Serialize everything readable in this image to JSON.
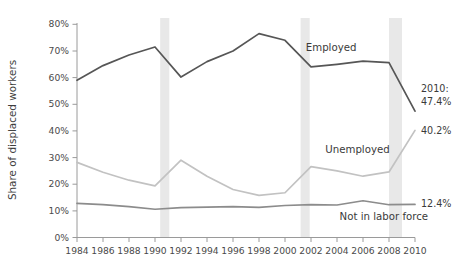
{
  "chart_data": {
    "type": "line",
    "title": "",
    "subtitle": "",
    "xlabel": "",
    "ylabel": "Share of displaced workers",
    "x": [
      1984,
      1986,
      1988,
      1990,
      1992,
      1994,
      1996,
      1998,
      2000,
      2002,
      2004,
      2006,
      2008,
      2010
    ],
    "xlim": [
      1984,
      2010
    ],
    "ylim": [
      0,
      80
    ],
    "y_tick_labels": [
      "0%",
      "10%",
      "20%",
      "30%",
      "40%",
      "50%",
      "60%",
      "70%",
      "80%"
    ],
    "y_tick_values": [
      0,
      10,
      20,
      30,
      40,
      50,
      60,
      70,
      80
    ],
    "x_tick_labels": [
      "1984",
      "1986",
      "1988",
      "1990",
      "1992",
      "1994",
      "1996",
      "1998",
      "2000",
      "2002",
      "2004",
      "2006",
      "2008",
      "2010"
    ],
    "grid": false,
    "legend": "inline-labels",
    "series": [
      {
        "name": "Employed",
        "color": "#565656",
        "width": 1.7,
        "values": [
          59.0,
          64.5,
          68.5,
          71.5,
          60.2,
          66.0,
          70.0,
          76.5,
          74.0,
          64.0,
          65.0,
          66.2,
          65.6,
          47.4
        ]
      },
      {
        "name": "Unemployed",
        "color": "#c2c2c2",
        "width": 1.7,
        "values": [
          28.2,
          24.5,
          21.5,
          19.4,
          29.0,
          23.0,
          18.0,
          15.8,
          16.8,
          26.6,
          25.0,
          23.0,
          24.6,
          40.2
        ]
      },
      {
        "name": "Not in labor force",
        "color": "#8c8c8c",
        "width": 1.7,
        "values": [
          12.8,
          12.3,
          11.6,
          10.6,
          11.2,
          11.4,
          11.6,
          11.3,
          12.0,
          12.3,
          12.2,
          13.8,
          12.3,
          12.4
        ]
      }
    ],
    "recession_bands": [
      {
        "start": 1990.4,
        "end": 1991.1
      },
      {
        "start": 2001.2,
        "end": 2001.9
      },
      {
        "start": 2008.0,
        "end": 2009.0
      }
    ],
    "recession_band_color": "#e8e8e8",
    "annotations": [
      {
        "name": "employed-series-label",
        "text": "Employed",
        "x": 2001.6,
        "y": 70.0
      },
      {
        "name": "unemployed-series-label",
        "text": "Unemployed",
        "x": 2003.1,
        "y": 31.8
      },
      {
        "name": "not-in-labor-force-series-label",
        "text": "Not in labor force",
        "x": 2004.2,
        "y": 6.4
      }
    ],
    "end_labels": [
      {
        "name": "employed-end-label-year",
        "text": "2010:",
        "value": "47.4%",
        "color": "#3a3a3a"
      },
      {
        "name": "unemployed-end-label",
        "text": "40.2%",
        "color": "#3a3a3a"
      },
      {
        "name": "not-in-labor-force-end-label",
        "text": "12.4%",
        "color": "#3a3a3a"
      }
    ]
  },
  "axis": {
    "y_title": "Share of displaced workers",
    "axis_color": "#9a9a9a"
  }
}
